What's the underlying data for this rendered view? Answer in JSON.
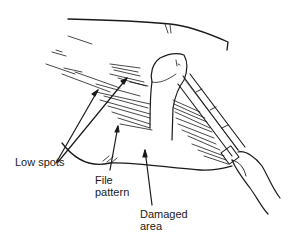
{
  "diagram": {
    "labels": {
      "low_spots": "Low spots",
      "file_pattern_line1": "File",
      "file_pattern_line2": "pattern",
      "damaged_area_line1": "Damaged",
      "damaged_area_line2": "area"
    },
    "colors": {
      "ink": "#1a1a1a",
      "background": "#ffffff"
    }
  }
}
